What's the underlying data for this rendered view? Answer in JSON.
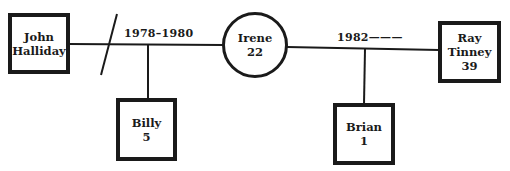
{
  "diagram": {
    "type": "genogram",
    "colors": {
      "stroke": "#1a1a1a",
      "background": "#ffffff"
    },
    "people": {
      "john": {
        "name_line1": "John",
        "name_line2": "Halliday",
        "shape": "square"
      },
      "irene": {
        "name": "Irene",
        "age": "22",
        "shape": "circle"
      },
      "ray": {
        "name_line1": "Ray",
        "name_line2": "Tinney",
        "age": "39",
        "shape": "square"
      },
      "billy": {
        "name": "Billy",
        "age": "5",
        "shape": "square"
      },
      "brian": {
        "name": "Brian",
        "age": "1",
        "shape": "square"
      }
    },
    "relationships": [
      {
        "id": "john-irene",
        "label": "1978–1980",
        "status": "divorced"
      },
      {
        "id": "irene-ray",
        "label": "1982———",
        "status": "married"
      }
    ]
  }
}
